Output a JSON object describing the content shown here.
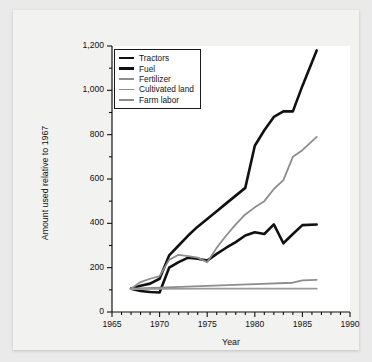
{
  "chart_data": {
    "type": "line",
    "title": "",
    "xlabel": "Year",
    "ylabel": "Amount used relative to 1967",
    "xlim": [
      1965,
      1990
    ],
    "ylim": [
      0,
      1200
    ],
    "xticks": [
      1965,
      1970,
      1975,
      1980,
      1985,
      1990
    ],
    "xtick_labels": [
      "1965",
      "1970",
      "1975",
      "1980",
      "1985",
      "1990"
    ],
    "yticks": [
      0,
      200,
      400,
      600,
      800,
      1000,
      1200
    ],
    "ytick_labels": [
      "0",
      "200",
      "400",
      "600",
      "800",
      "1,000",
      "1,200"
    ],
    "minor_ytick_step": 100,
    "minor_xtick_step": 1,
    "grid": false,
    "legend_position": "top-left",
    "series": [
      {
        "name": "Tractors",
        "color": "#111111",
        "width": 2.6,
        "x": [
          1967,
          1968,
          1969,
          1970,
          1971,
          1972,
          1973,
          1974,
          1975,
          1976,
          1977,
          1978,
          1979,
          1980,
          1981,
          1982,
          1983,
          1984,
          1985,
          1986.5
        ],
        "values": [
          105,
          118,
          128,
          150,
          255,
          300,
          345,
          385,
          420,
          455,
          490,
          525,
          560,
          750,
          820,
          880,
          905,
          905,
          1020,
          1180
        ]
      },
      {
        "name": "Fuel",
        "color": "#111111",
        "width": 2.6,
        "x": [
          1967,
          1968,
          1969,
          1970,
          1971,
          1972,
          1973,
          1974,
          1975,
          1976,
          1977,
          1978,
          1979,
          1980,
          1981,
          1982,
          1983,
          1984,
          1985,
          1986.5
        ],
        "values": [
          105,
          95,
          90,
          88,
          200,
          225,
          245,
          240,
          232,
          262,
          290,
          315,
          345,
          360,
          352,
          395,
          310,
          352,
          392,
          395
        ]
      },
      {
        "name": "Fertilizer",
        "color": "#8d8d8d",
        "width": 1.8,
        "x": [
          1967,
          1968,
          1969,
          1970,
          1971,
          1972,
          1973,
          1974,
          1975,
          1976,
          1977,
          1978,
          1979,
          1980,
          1981,
          1982,
          1983,
          1984,
          1985,
          1986.5
        ],
        "values": [
          105,
          135,
          150,
          162,
          235,
          258,
          252,
          245,
          225,
          290,
          345,
          395,
          440,
          472,
          500,
          555,
          595,
          700,
          730,
          790
        ]
      },
      {
        "name": "Cultivated land",
        "color": "#8d8d8d",
        "width": 1.8,
        "x": [
          1967,
          1970,
          1975,
          1980,
          1984,
          1985,
          1986.5
        ],
        "values": [
          105,
          110,
          118,
          126,
          132,
          143,
          145
        ]
      },
      {
        "name": "Farm labor",
        "color": "#9a9a9a",
        "width": 1.8,
        "x": [
          1967,
          1970,
          1975,
          1980,
          1985,
          1986.5
        ],
        "values": [
          103,
          104,
          105,
          105,
          105,
          105
        ]
      }
    ]
  },
  "legend": {
    "items": [
      {
        "label": "Tractors"
      },
      {
        "label": "Fuel"
      },
      {
        "label": "Fertilizer"
      },
      {
        "label": "Cultivated land"
      },
      {
        "label": "Farm labor"
      }
    ]
  }
}
